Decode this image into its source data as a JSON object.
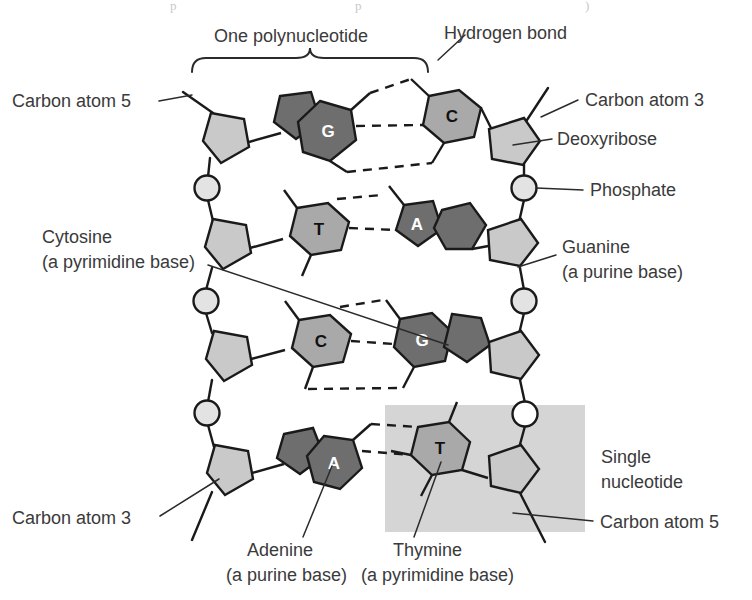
{
  "figure": {
    "background": "#ffffff"
  },
  "palette": {
    "purine_fill": "#6e6e6e",
    "purine_letter": "#ffffff",
    "pyrimidine_fill": "#a9a9a9",
    "pyrimidine_letter": "#111111",
    "sugar_fill": "#c9c9c9",
    "phosphate_fill": "#e3e3e3",
    "outline": "#1a1a1a",
    "highlight_box": "#d5d5d5",
    "label_text": "#3a3a3a",
    "leader_line": "#2b2b2b"
  },
  "labels": {
    "one_polynucleotide": "One polynucleotide",
    "hydrogen_bond": "Hydrogen bond",
    "carbon_atom_5_top": "Carbon atom 5",
    "carbon_atom_3_top": "Carbon atom 3",
    "deoxyribose": "Deoxyribose",
    "phosphate": "Phosphate",
    "cytosine_line1": "Cytosine",
    "cytosine_line2": "(a pyrimidine base)",
    "guanine_line1": "Guanine",
    "guanine_line2": "(a purine base)",
    "single_nucleotide_line1": "Single",
    "single_nucleotide_line2": "nucleotide",
    "carbon_atom_3_bottom": "Carbon atom 3",
    "carbon_atom_5_bottom": "Carbon atom 5",
    "adenine_line1": "Adenine",
    "adenine_line2": "(a purine base)",
    "thymine_line1": "Thymine",
    "thymine_line2": "(a pyrimidine base)"
  },
  "base_pairs": [
    {
      "row": 1,
      "left_base": "G",
      "left_type": "purine",
      "right_base": "C",
      "right_type": "pyrimidine",
      "hydrogen_bonds": 3
    },
    {
      "row": 2,
      "left_base": "T",
      "left_type": "pyrimidine",
      "right_base": "A",
      "right_type": "purine",
      "hydrogen_bonds": 2
    },
    {
      "row": 3,
      "left_base": "C",
      "left_type": "pyrimidine",
      "right_base": "G",
      "right_type": "purine",
      "hydrogen_bonds": 3
    },
    {
      "row": 4,
      "left_base": "A",
      "left_type": "purine",
      "right_base": "T",
      "right_type": "pyrimidine",
      "hydrogen_bonds": 2
    }
  ],
  "components": {
    "sugar_name": "Deoxyribose",
    "phosphate_name": "Phosphate",
    "sugar_count": 8,
    "phosphate_count": 6
  },
  "ghost_text": "p          p          )"
}
